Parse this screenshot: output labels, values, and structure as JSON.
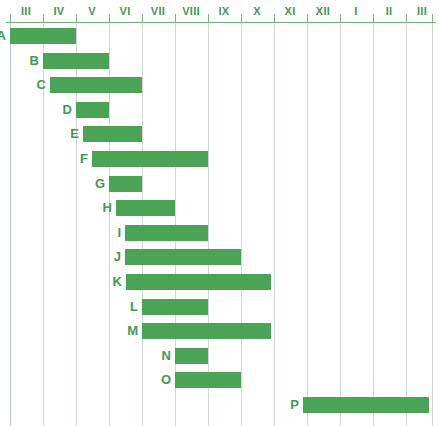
{
  "chart_data": {
    "type": "bar",
    "subtype": "gantt-range-bar",
    "title": "",
    "xlabel": "",
    "ylabel": "",
    "orientation": "horizontal",
    "grid": true,
    "legend": "none",
    "bar_color": "#4ba355",
    "axis_color": "#3f9a52",
    "grid_color": "#cfd9d2",
    "axis": {
      "tick_labels": [
        "III",
        "IV",
        "V",
        "VI",
        "VII",
        "VIII",
        "IX",
        "X",
        "XI",
        "XII",
        "I",
        "II",
        "III"
      ],
      "tick_positions_px": [
        26,
        59,
        92,
        125,
        158,
        191,
        224,
        257,
        290,
        323,
        356,
        389,
        422
      ],
      "gridline_positions_px": [
        10,
        43,
        76,
        109,
        142,
        175,
        208,
        241,
        274,
        307,
        340,
        373,
        406,
        432
      ],
      "unit": "month",
      "range_start": "III",
      "range_end": "III"
    },
    "categories": [
      "A",
      "B",
      "C",
      "D",
      "E",
      "F",
      "G",
      "H",
      "I",
      "J",
      "K",
      "L",
      "M",
      "N",
      "O",
      "P"
    ],
    "bars": [
      {
        "label": "A",
        "start": 0.0,
        "end": 2.0,
        "start_px": 10,
        "end_px": 76,
        "start_month": "III",
        "end_month": "V"
      },
      {
        "label": "B",
        "start": 1.0,
        "end": 3.0,
        "start_px": 43,
        "end_px": 109,
        "start_month": "IV",
        "end_month": "VI"
      },
      {
        "label": "C",
        "start": 1.2,
        "end": 4.0,
        "start_px": 50,
        "end_px": 142,
        "start_month": "IV",
        "end_month": "VII"
      },
      {
        "label": "D",
        "start": 2.0,
        "end": 3.0,
        "start_px": 76,
        "end_px": 109,
        "start_month": "V",
        "end_month": "VI"
      },
      {
        "label": "E",
        "start": 2.2,
        "end": 4.0,
        "start_px": 83,
        "end_px": 142,
        "start_month": "V",
        "end_month": "VII"
      },
      {
        "label": "F",
        "start": 2.5,
        "end": 6.0,
        "start_px": 92,
        "end_px": 208,
        "start_month": "V",
        "end_month": "IX"
      },
      {
        "label": "G",
        "start": 3.0,
        "end": 4.0,
        "start_px": 109,
        "end_px": 142,
        "start_month": "VI",
        "end_month": "VII"
      },
      {
        "label": "H",
        "start": 3.2,
        "end": 5.0,
        "start_px": 116,
        "end_px": 175,
        "start_month": "VI",
        "end_month": "VIII"
      },
      {
        "label": "I",
        "start": 3.5,
        "end": 6.0,
        "start_px": 125,
        "end_px": 208,
        "start_month": "VI",
        "end_month": "IX"
      },
      {
        "label": "J",
        "start": 3.5,
        "end": 7.0,
        "start_px": 125,
        "end_px": 241,
        "start_month": "VI",
        "end_month": "X"
      },
      {
        "label": "K",
        "start": 3.5,
        "end": 7.9,
        "start_px": 126,
        "end_px": 271,
        "start_month": "VI",
        "end_month": "X"
      },
      {
        "label": "L",
        "start": 4.0,
        "end": 6.0,
        "start_px": 142,
        "end_px": 208,
        "start_month": "VII",
        "end_month": "IX"
      },
      {
        "label": "M",
        "start": 4.0,
        "end": 7.9,
        "start_px": 142,
        "end_px": 271,
        "start_month": "VII",
        "end_month": "X"
      },
      {
        "label": "N",
        "start": 5.0,
        "end": 6.0,
        "start_px": 175,
        "end_px": 208,
        "start_month": "VIII",
        "end_month": "IX"
      },
      {
        "label": "O",
        "start": 5.0,
        "end": 7.0,
        "start_px": 175,
        "end_px": 241,
        "start_month": "VIII",
        "end_month": "X"
      },
      {
        "label": "P",
        "start": 8.9,
        "end": 12.7,
        "start_px": 303,
        "end_px": 429,
        "start_month": "XII",
        "end_month": "III"
      }
    ]
  }
}
